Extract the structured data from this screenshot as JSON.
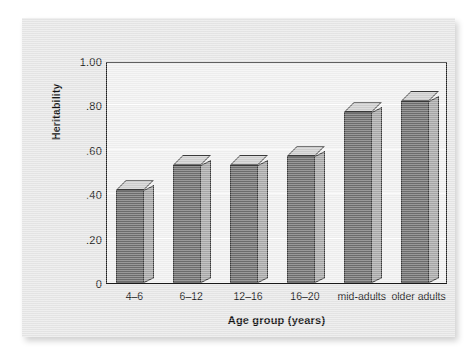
{
  "chart_data": {
    "type": "bar",
    "title": "",
    "xlabel": "Age group (years)",
    "ylabel": "Heritability",
    "categories": [
      "4–6",
      "6–12",
      "12–16",
      "16–20",
      "mid-adults",
      "older adults"
    ],
    "values": [
      0.42,
      0.53,
      0.53,
      0.57,
      0.77,
      0.82
    ],
    "ylim": [
      0,
      1.0
    ],
    "ytick_values": [
      1.0,
      0.8,
      0.6,
      0.4,
      0.2,
      0
    ],
    "ytick_labels": [
      "1.00",
      ".80",
      ".60",
      ".40",
      ".20",
      "0"
    ],
    "grid": true,
    "gridlines_at": [
      0.8,
      0.6,
      0.4,
      0.2
    ],
    "legend": null,
    "legend_position": "none",
    "bar_style": "3d-extruded",
    "colors": {
      "bar_front": "#6e6e6e",
      "bar_side": "#a9a9a9",
      "bar_top": "#cfcfcf",
      "bar_outline": "#3a3a3a",
      "plot_background": "#f2f2f2",
      "figure_background": "#e8e8e8",
      "gridline": "#ffffff",
      "axis_line": "#1a1a1a",
      "text": "#1a1a1a"
    }
  }
}
